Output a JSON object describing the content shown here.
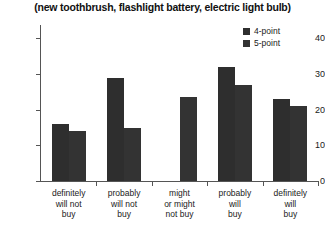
{
  "chart_data": {
    "type": "bar",
    "title": "(new toothbrush, flashlight battery, electric light bulb)",
    "xlabel": "",
    "ylabel": "",
    "ylim": [
      0,
      43.5
    ],
    "yticks": [
      0,
      10,
      20,
      30,
      40
    ],
    "ytick_labels": [
      "0",
      "10",
      "20",
      "30",
      "40"
    ],
    "grid": false,
    "legend_position": "top-right",
    "categories": [
      "definitely will not buy",
      "probably will not buy",
      "might or might not buy",
      "probably will buy",
      "definitely will buy"
    ],
    "category_lines": [
      [
        "definitely",
        "will not",
        "buy"
      ],
      [
        "probably",
        "will not",
        "buy"
      ],
      [
        "might",
        "or might",
        "not buy"
      ],
      [
        "probably",
        "will",
        "buy"
      ],
      [
        "definitely",
        "will",
        "buy"
      ]
    ],
    "series": [
      {
        "name": "4-point",
        "color": "#2e2e2e",
        "values": [
          16,
          29,
          null,
          32,
          23
        ]
      },
      {
        "name": "5-point",
        "color": "#333333",
        "values": [
          14,
          15,
          23.5,
          27,
          21
        ]
      }
    ]
  },
  "legend": {
    "items": [
      {
        "label": "4-point",
        "color": "#2e2e2e"
      },
      {
        "label": "5-point",
        "color": "#333333"
      }
    ]
  },
  "axis": {
    "line_color": "#555555"
  }
}
